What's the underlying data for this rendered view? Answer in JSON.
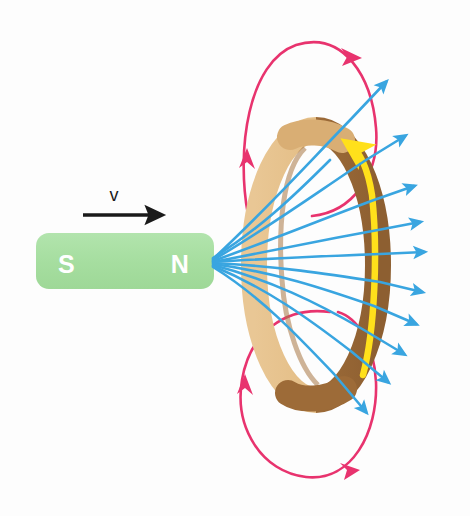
{
  "figure": {
    "background_color": "#fdfdfd"
  },
  "magnet": {
    "name": "bar-magnet",
    "south_label": "S",
    "north_label": "N",
    "body_color": "#a8dfa2",
    "label_color": "#ffffff",
    "x": 36,
    "y": 233,
    "width": 178,
    "height": 56,
    "corner_radius": 12
  },
  "velocity": {
    "label": "v",
    "label_color": "#1a1a1a",
    "arrow_color": "#1a1a1a",
    "label_x": 114,
    "label_y": 200,
    "arrow_start_x": 83,
    "arrow_end_x": 163,
    "arrow_y": 215
  },
  "ring": {
    "name": "conducting-ring",
    "light_color": "#e6c18c",
    "dark_color": "#9d6b38",
    "mid_color": "#c08c4e",
    "center_x": 316,
    "center_y": 265,
    "radius_x": 62,
    "radius_y": 135,
    "band_width": 26
  },
  "induced_current": {
    "name": "induced-current-arrow",
    "color": "#ffe01b",
    "direction": "counterclockwise-up-right-side",
    "description": "Induced current in ring"
  },
  "magnetic_field_lines": {
    "name": "magnetic-field-lines",
    "color": "#39a5e0",
    "source_x": 213,
    "source_y": 262,
    "count": 11,
    "description": "Field lines emanating from N pole through the ring"
  },
  "induced_field_loops": {
    "name": "induced-field-loops",
    "color": "#e8336e",
    "count": 2,
    "upper_loop": {
      "top_y": 42,
      "bottom_y": 215
    },
    "lower_loop": {
      "top_y": 310,
      "bottom_y": 478
    },
    "description": "Induced magnetic field loops around the ring"
  },
  "colors": {
    "magnet_green": "#a8dfa2",
    "ring_light": "#e6c18c",
    "ring_dark": "#9d6b38",
    "field_blue": "#39a5e0",
    "induced_pink": "#e8336e",
    "current_yellow": "#ffe01b",
    "arrow_black": "#1a1a1a"
  }
}
